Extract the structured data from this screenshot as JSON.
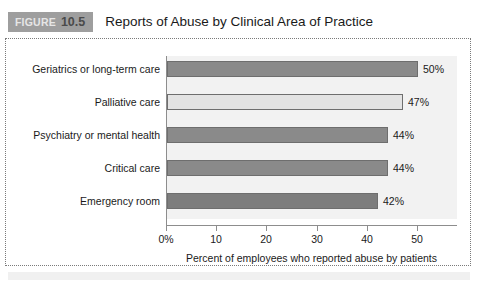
{
  "figure": {
    "badge_word": "FIGURE",
    "badge_number": "10.5",
    "title": "Reports of Abuse by Clinical Area of Practice"
  },
  "colors": {
    "badge_background": "#9e9e9e",
    "panel_background": "#f2f2f2",
    "axis_line": "#8d8d8d",
    "bar_border": "#6e6e6e",
    "bar_dark": "#8a8a8a",
    "bar_light": "#e3e3e3",
    "bar_darkest": "#7d7d7d",
    "frame_border": "#7a7a7a",
    "text": "#1a1a1a"
  },
  "chart_data": {
    "type": "bar",
    "orientation": "horizontal",
    "title": "Reports of Abuse by Clinical Area of Practice",
    "subtitle": "",
    "categories": [
      "Geriatrics or long-term care",
      "Palliative care",
      "Psychiatry or mental health",
      "Critical care",
      "Emergency room"
    ],
    "values": [
      50,
      47,
      44,
      44,
      42
    ],
    "value_labels": [
      "50%",
      "47%",
      "44%",
      "44%",
      "42%"
    ],
    "bar_colors": [
      "#8a8a8a",
      "#e3e3e3",
      "#8a8a8a",
      "#8a8a8a",
      "#7d7d7d"
    ],
    "xlabel": "Percent of employees who reported abuse by patients",
    "ylabel": "",
    "xlim": [
      0,
      58
    ],
    "xticks": [
      0,
      10,
      20,
      30,
      40,
      50
    ],
    "xtick_labels": [
      "0%",
      "10",
      "20",
      "30",
      "40",
      "50"
    ],
    "grid": false,
    "legend": false
  }
}
